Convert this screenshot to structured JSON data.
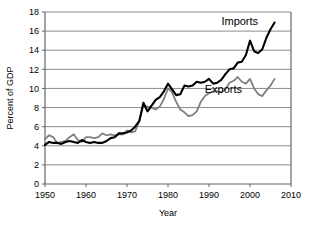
{
  "chart_data": {
    "type": "line",
    "title": "",
    "xlabel": "Year",
    "ylabel": "Percent of GDP",
    "xlim": [
      1950,
      2010
    ],
    "ylim": [
      0,
      18
    ],
    "xticks": [
      1950,
      1960,
      1970,
      1980,
      1990,
      2000,
      2010
    ],
    "yticks": [
      0,
      2,
      4,
      6,
      8,
      10,
      12,
      14,
      16,
      18
    ],
    "grid": "horizontal",
    "legend": "inline-annotations",
    "annotations": [
      {
        "text": "Imports",
        "x": 1997.5,
        "y": 16.6
      },
      {
        "text": "Exports",
        "x": 1993.5,
        "y": 9.5
      }
    ],
    "series": [
      {
        "name": "Imports",
        "color": "#000000",
        "x": [
          1950,
          1951,
          1952,
          1953,
          1954,
          1955,
          1956,
          1957,
          1958,
          1959,
          1960,
          1961,
          1962,
          1963,
          1964,
          1965,
          1966,
          1967,
          1968,
          1969,
          1970,
          1971,
          1972,
          1973,
          1974,
          1975,
          1976,
          1977,
          1978,
          1979,
          1980,
          1981,
          1982,
          1983,
          1984,
          1985,
          1986,
          1987,
          1988,
          1989,
          1990,
          1991,
          1992,
          1993,
          1994,
          1995,
          1996,
          1997,
          1998,
          1999,
          2000,
          2001,
          2002,
          2003,
          2004,
          2005,
          2006
        ],
        "values": [
          4.1,
          4.4,
          4.3,
          4.3,
          4.2,
          4.4,
          4.5,
          4.4,
          4.3,
          4.6,
          4.4,
          4.3,
          4.4,
          4.3,
          4.3,
          4.5,
          4.8,
          4.9,
          5.3,
          5.3,
          5.4,
          5.6,
          6.0,
          6.6,
          8.5,
          7.6,
          8.2,
          8.8,
          9.1,
          9.7,
          10.5,
          9.9,
          9.3,
          9.4,
          10.3,
          10.2,
          10.3,
          10.7,
          10.6,
          10.7,
          11.0,
          10.5,
          10.6,
          10.9,
          11.5,
          12.0,
          12.1,
          12.7,
          12.8,
          13.5,
          15.0,
          13.9,
          13.7,
          14.1,
          15.3,
          16.2,
          16.9
        ]
      },
      {
        "name": "Exports",
        "color": "#808080",
        "x": [
          1950,
          1951,
          1952,
          1953,
          1954,
          1955,
          1956,
          1957,
          1958,
          1959,
          1960,
          1961,
          1962,
          1963,
          1964,
          1965,
          1966,
          1967,
          1968,
          1969,
          1970,
          1971,
          1972,
          1973,
          1974,
          1975,
          1976,
          1977,
          1978,
          1979,
          1980,
          1981,
          1982,
          1983,
          1984,
          1985,
          1986,
          1987,
          1988,
          1989,
          1990,
          1991,
          1992,
          1993,
          1994,
          1995,
          1996,
          1997,
          1998,
          1999,
          2000,
          2001,
          2002,
          2003,
          2004,
          2005,
          2006
        ],
        "values": [
          4.7,
          5.1,
          4.9,
          4.3,
          4.4,
          4.5,
          4.9,
          5.2,
          4.6,
          4.4,
          4.9,
          4.9,
          4.8,
          4.9,
          5.3,
          5.1,
          5.2,
          5.1,
          5.2,
          5.2,
          5.6,
          5.4,
          5.5,
          6.6,
          8.2,
          8.1,
          8.0,
          7.8,
          8.1,
          8.9,
          10.0,
          9.6,
          8.6,
          7.8,
          7.5,
          7.1,
          7.2,
          7.6,
          8.6,
          9.2,
          9.5,
          9.7,
          9.7,
          9.6,
          9.9,
          10.6,
          10.8,
          11.2,
          10.7,
          10.5,
          11.0,
          10.0,
          9.4,
          9.2,
          9.8,
          10.3,
          11.0
        ]
      }
    ]
  },
  "axes": {
    "y_title": "Percent of GDP",
    "x_title": "Year",
    "y_tick_labels": [
      "0",
      "2",
      "4",
      "6",
      "8",
      "10",
      "12",
      "14",
      "16",
      "18"
    ],
    "x_tick_labels": [
      "1950",
      "1960",
      "1970",
      "1980",
      "1990",
      "2000",
      "2010"
    ]
  },
  "series_labels": {
    "imports": "Imports",
    "exports": "Exports"
  },
  "colors": {
    "imports_line": "#000000",
    "exports_line": "#808080",
    "grid": "#808080",
    "axis": "#666666",
    "background": "#ffffff"
  }
}
